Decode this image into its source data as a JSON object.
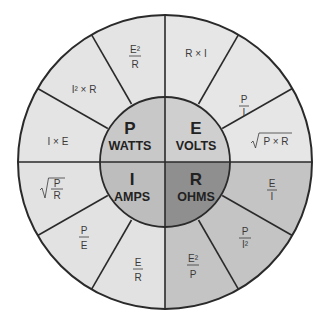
{
  "colors": {
    "outline": "#2a2a2a",
    "p_outer": "#e4e4e4",
    "e_outer": "#e6e6e6",
    "i_outer": "#e2e2e2",
    "r_outer": "#c4c4c4",
    "p_core": "#c8c8c8",
    "e_core": "#cfcfcf",
    "i_core": "#bdbdbd",
    "r_core": "#8f8f8f"
  },
  "core": {
    "p": {
      "symbol": "P",
      "unit": "WATTS"
    },
    "e": {
      "symbol": "E",
      "unit": "VOLTS"
    },
    "i": {
      "symbol": "I",
      "unit": "AMPS"
    },
    "r": {
      "symbol": "R",
      "unit": "OHMS"
    }
  },
  "formulas": {
    "e": [
      {
        "type": "text",
        "text": "R × I"
      },
      {
        "type": "frac",
        "num": "P",
        "den": "I"
      },
      {
        "type": "sqrt",
        "text": "P × R"
      }
    ],
    "r": [
      {
        "type": "frac",
        "num": "E",
        "den": "I"
      },
      {
        "type": "frac",
        "num": "P",
        "den": "I²"
      },
      {
        "type": "frac",
        "num": "E²",
        "den": "P"
      }
    ],
    "i": [
      {
        "type": "frac",
        "num": "E",
        "den": "R"
      },
      {
        "type": "frac",
        "num": "P",
        "den": "E"
      },
      {
        "type": "sqrtfrac",
        "num": "P",
        "den": "R"
      }
    ],
    "p": [
      {
        "type": "text",
        "text": "I × E"
      },
      {
        "type": "text",
        "text": "I² × R"
      },
      {
        "type": "frac",
        "num": "E²",
        "den": "R"
      }
    ]
  }
}
